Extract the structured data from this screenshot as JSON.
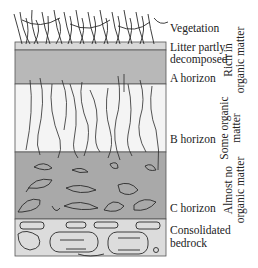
{
  "diagram": {
    "type": "soil-profile",
    "colors": {
      "vegetation_line": "#2a2a2a",
      "litter": "#d8d8d8",
      "a_horizon": "#b8b8b8",
      "b_horizon": "#f4f4f4",
      "c_horizon": "#a9a9a9",
      "bedrock": "#dcdcdc",
      "outline": "#444444"
    },
    "layers": [
      {
        "name": "Vegetation",
        "label_lines": [
          "Vegetation"
        ]
      },
      {
        "name": "Litter partly decomposed",
        "label_lines": [
          "Litter partly",
          "decomposed"
        ]
      },
      {
        "name": "A horizon",
        "label_lines": [
          "A horizon"
        ]
      },
      {
        "name": "B horizon",
        "label_lines": [
          "B horizon"
        ]
      },
      {
        "name": "C horizon",
        "label_lines": [
          "C horizon"
        ]
      },
      {
        "name": "Consolidated bedrock",
        "label_lines": [
          "Consolidated",
          "bedrock"
        ]
      }
    ],
    "organic_content": [
      {
        "lines": [
          "Rich in",
          "organic matter"
        ]
      },
      {
        "lines": [
          "Some organic",
          "matter"
        ]
      },
      {
        "lines": [
          "Almost no",
          "organic matter"
        ]
      }
    ]
  }
}
